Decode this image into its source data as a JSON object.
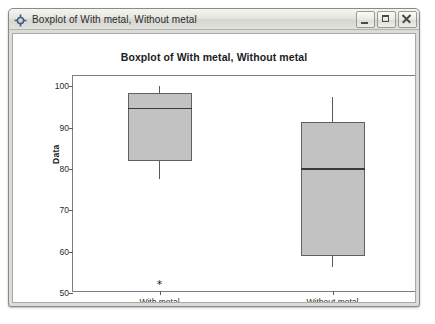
{
  "window": {
    "title": "Boxplot of With metal, Without metal",
    "icon": "minitab-crosshair-icon",
    "controls": {
      "minimize_label": "Minimize",
      "maximize_label": "Maximize",
      "close_label": "Close"
    }
  },
  "chart_data": {
    "type": "box",
    "title": "Boxplot of With metal, Without metal",
    "xlabel": "",
    "ylabel": "Data",
    "categories": [
      "With metal",
      "Without metal"
    ],
    "ylim": [
      50,
      102.5
    ],
    "yticks": [
      50,
      60,
      70,
      80,
      90,
      100
    ],
    "ytick_labels": [
      "50",
      "60",
      "70",
      "80",
      "90",
      "100"
    ],
    "grid": false,
    "legend": "none",
    "boxes": [
      {
        "name": "With metal",
        "whisker_low": 77.5,
        "q1": 81.9,
        "median": 94.8,
        "q3": 98.3,
        "whisker_high": 100.2,
        "outliers": [
          52.2
        ]
      },
      {
        "name": "Without metal",
        "whisker_low": 56.4,
        "q1": 58.9,
        "median": 80.2,
        "q3": 91.3,
        "whisker_high": 97.3,
        "outliers": []
      }
    ],
    "colors": {
      "box_fill": "#c2c2c2",
      "box_edge": "#606060",
      "median": "#3a3a3a",
      "whisker": "#5a5a5a",
      "frame": "#7d7d7d",
      "plot_background": "#ffffff"
    }
  }
}
